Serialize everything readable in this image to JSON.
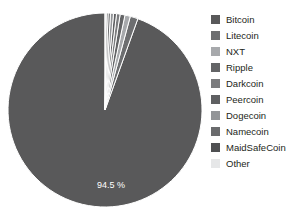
{
  "chart_data": {
    "type": "pie",
    "title": "",
    "labels": [
      "Bitcoin",
      "Litecoin",
      "NXT",
      "Ripple",
      "Darkcoin",
      "Peercoin",
      "Dogecoin",
      "Namecoin",
      "MaidSafeCoin",
      "Other"
    ],
    "values": [
      94.5,
      1.3,
      0.9,
      0.8,
      0.6,
      0.5,
      0.5,
      0.4,
      0.3,
      0.2
    ],
    "colors": [
      "#59595a",
      "#6d6e70",
      "#a7a9ac",
      "#636466",
      "#7b7c7e",
      "#5f6062",
      "#939598",
      "#6a6b6d",
      "#4f5052",
      "#e6e7e8"
    ],
    "data_labels": [
      "94.5 %",
      "",
      "",
      "",
      "",
      "",
      "",
      "",
      "",
      ""
    ],
    "start_angle_deg": 90,
    "direction": "counterclockwise",
    "legend_position": "right",
    "grid": false,
    "separator_color": "#ffffff"
  },
  "legend": {
    "items": [
      {
        "label": "Bitcoin",
        "color": "#59595a"
      },
      {
        "label": "Litecoin",
        "color": "#6d6e70"
      },
      {
        "label": "NXT",
        "color": "#a7a9ac"
      },
      {
        "label": "Ripple",
        "color": "#636466"
      },
      {
        "label": "Darkcoin",
        "color": "#7b7c7e"
      },
      {
        "label": "Peercoin",
        "color": "#5f6062"
      },
      {
        "label": "Dogecoin",
        "color": "#939598"
      },
      {
        "label": "Namecoin",
        "color": "#6a6b6d"
      },
      {
        "label": "MaidSafeCoin",
        "color": "#4f5052"
      },
      {
        "label": "Other",
        "color": "#e6e7e8"
      }
    ]
  },
  "pie": {
    "center_x": 105,
    "center_y": 110,
    "radius": 97,
    "main_label": "94.5 %",
    "main_label_x": 111,
    "main_label_y": 186
  }
}
